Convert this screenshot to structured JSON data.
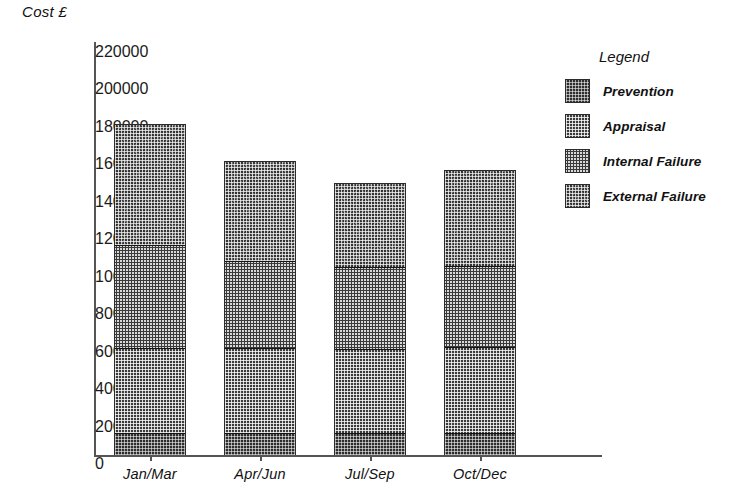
{
  "chart_data": {
    "type": "bar",
    "subtype": "stacked-vertical",
    "title": "",
    "ylabel": "Cost £",
    "xlabel": "",
    "categories": [
      "Jan/Mar",
      "Apr/Jun",
      "Jul/Sep",
      "Oct/Dec"
    ],
    "series": [
      {
        "name": "Prevention",
        "values": [
          11500,
          11500,
          11500,
          11500
        ]
      },
      {
        "name": "Appraisal",
        "values": [
          45500,
          45500,
          45000,
          46000
        ]
      },
      {
        "name": "Internal Failure",
        "values": [
          55000,
          46500,
          43500,
          43000
        ]
      },
      {
        "name": "External Failure",
        "values": [
          65000,
          53500,
          45500,
          51500
        ]
      }
    ],
    "totals": [
      177000,
      157000,
      145500,
      152000
    ],
    "ylim": [
      0,
      220000
    ],
    "ytick_step": 20000,
    "yticks": [
      220000,
      200000,
      180000,
      160000,
      140000,
      120000,
      100000,
      80000,
      60000,
      40000,
      20000,
      0
    ],
    "ytick_labels": [
      "220000",
      "200000",
      "180000",
      "160000",
      "140000",
      "120000",
      "100000",
      "80000",
      "60000",
      "40000",
      "20000",
      "0"
    ],
    "grid": false,
    "legend_position": "right",
    "legend_title": "Legend",
    "stack_order_bottom_to_top": [
      "Prevention",
      "Appraisal",
      "Internal Failure",
      "External Failure"
    ]
  },
  "axis": {
    "y_title": "Cost £"
  },
  "legend": {
    "title": "Legend",
    "items": [
      {
        "label": "Prevention",
        "swatch": "prevention"
      },
      {
        "label": "Appraisal",
        "swatch": "appraisal"
      },
      {
        "label": "Internal Failure",
        "swatch": "internal"
      },
      {
        "label": "External Failure",
        "swatch": "external"
      }
    ]
  },
  "colors": {
    "prevention": "#2e2e2e",
    "appraisal": "#3b3b3b",
    "internal_failure": "#3a3a3a",
    "external_failure": "#343434",
    "axis": "#555555",
    "text": "#111111",
    "background": "#ffffff"
  }
}
